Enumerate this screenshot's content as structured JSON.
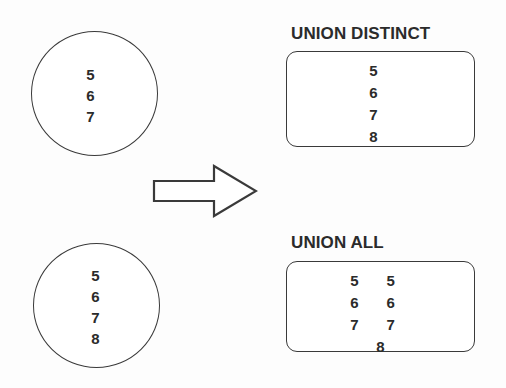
{
  "diagram": {
    "type": "set-operation-illustration",
    "stroke_color": "#3a3a3a",
    "text_color": "#2b2b2b",
    "background_color": "#ffffff",
    "arrow": {
      "icon": "right-block-arrow-icon",
      "direction": "right"
    },
    "inputs": [
      {
        "id": "set-a",
        "shape": "circle",
        "values": [
          "5",
          "6",
          "7"
        ]
      },
      {
        "id": "set-b",
        "shape": "circle",
        "values": [
          "5",
          "6",
          "7",
          "8"
        ]
      }
    ],
    "results": [
      {
        "id": "union-distinct",
        "caption": "UNION DISTINCT",
        "shape": "rounded-rect",
        "layout": "single-column",
        "values": [
          "5",
          "6",
          "7",
          "8"
        ]
      },
      {
        "id": "union-all",
        "caption": "UNION ALL",
        "shape": "rounded-rect",
        "layout": "two-column-with-tail",
        "column_left": [
          "5",
          "6",
          "7"
        ],
        "column_right": [
          "5",
          "6",
          "7"
        ],
        "tail": "8"
      }
    ]
  }
}
